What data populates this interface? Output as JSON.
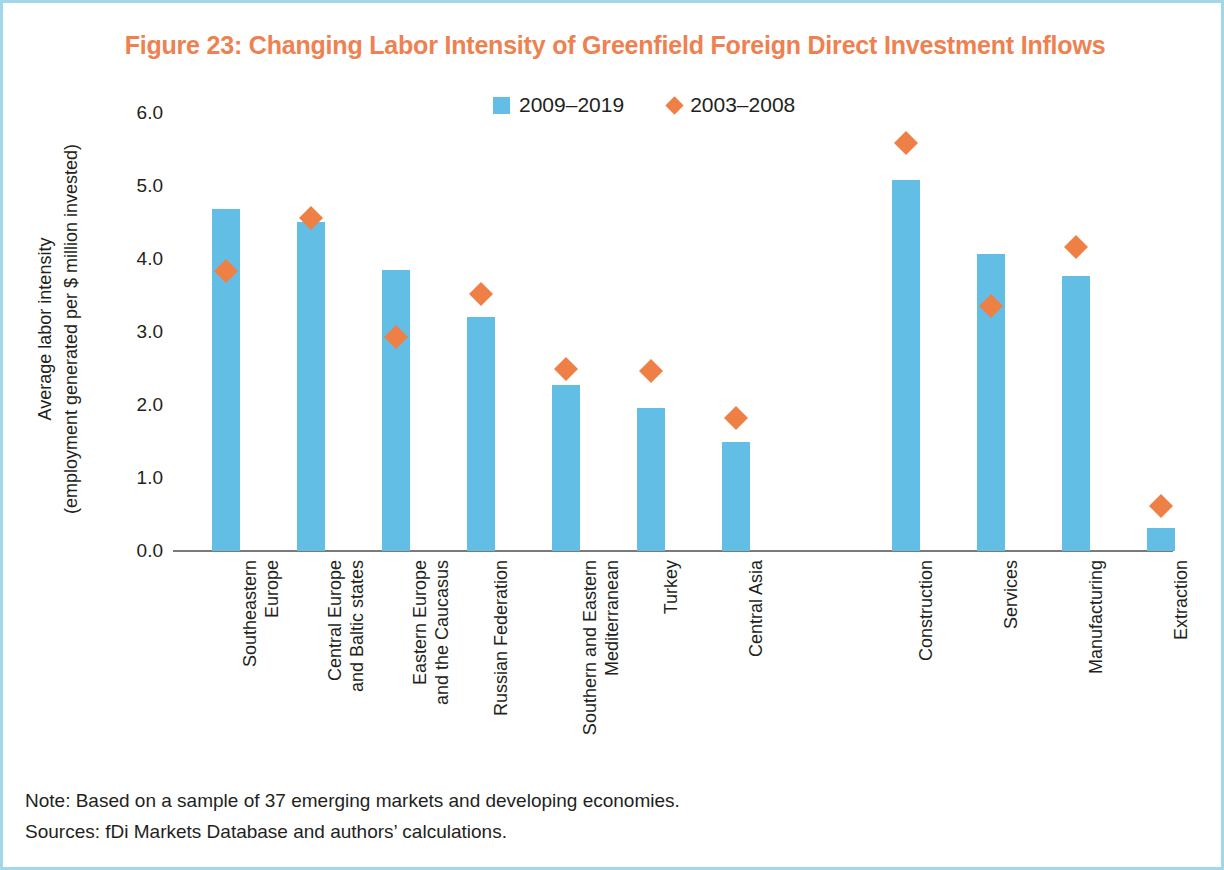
{
  "figure": {
    "title": "Figure 23: Changing Labor Intensity of Greenfield Foreign Direct Investment Inflows",
    "title_color": "#ef8150",
    "border_color": "#9fd8e8"
  },
  "notes": {
    "note": "Note: Based on a sample of 37 emerging markets and developing economies.",
    "sources": "Sources: fDi Markets Database and authors’ calculations."
  },
  "legend": {
    "position": "top-center",
    "entries": [
      {
        "label": "2009–2019",
        "marker": "square",
        "color": "#63bee6"
      },
      {
        "label": "2003–2008",
        "marker": "diamond",
        "color": "#ee7f45"
      }
    ]
  },
  "axis": {
    "y_title_line1": "Average labor intensity",
    "y_title_line2": "(employment generated per $ million invested)",
    "y_ticks": [
      "0.0",
      "1.0",
      "2.0",
      "3.0",
      "4.0",
      "5.0",
      "6.0"
    ]
  },
  "chart_data": {
    "type": "bar",
    "title": "Figure 23: Changing Labor Intensity of Greenfield Foreign Direct Investment Inflows",
    "xlabel": "",
    "ylabel": "Average labor intensity (employment generated per $ million invested)",
    "ylim": [
      0.0,
      6.0
    ],
    "ytick_step": 1.0,
    "grid": false,
    "legend_position": "top-center",
    "categories": [
      "Southeastern Europe",
      "Central Europe and Baltic states",
      "Eastern Europe and the Caucasus",
      "Russian Federation",
      "Southern and Eastern Mediterranean",
      "Turkey",
      "Central Asia",
      "Construction",
      "Services",
      "Manufacturing",
      "Extraction"
    ],
    "category_label_lines": [
      [
        "Southeastern",
        "Europe"
      ],
      [
        "Central Europe",
        "and Baltic states"
      ],
      [
        "Eastern Europe",
        "and the Caucasus"
      ],
      [
        "Russian Federation"
      ],
      [
        "Southern and Eastern",
        "Mediterranean"
      ],
      [
        "Turkey"
      ],
      [
        "Central Asia"
      ],
      [
        "Construction"
      ],
      [
        "Services"
      ],
      [
        "Manufacturing"
      ],
      [
        "Extraction"
      ]
    ],
    "groups": [
      {
        "name": "regions",
        "categories": 7
      },
      {
        "name": "sectors",
        "categories": 4
      }
    ],
    "series": [
      {
        "name": "2009–2019",
        "type": "bar",
        "color": "#63bee6",
        "values": [
          4.68,
          4.51,
          3.85,
          3.21,
          2.27,
          1.96,
          1.49,
          5.08,
          4.07,
          3.77,
          0.32
        ]
      },
      {
        "name": "2003–2008",
        "type": "scatter",
        "marker": "diamond",
        "color": "#ee7f45",
        "values": [
          3.84,
          4.56,
          2.93,
          3.52,
          2.49,
          2.47,
          1.82,
          5.59,
          3.36,
          4.16,
          0.62
        ]
      }
    ]
  }
}
